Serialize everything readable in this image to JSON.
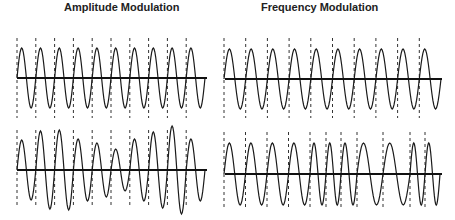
{
  "titles": {
    "am": "Amplitude Modulation",
    "fm": "Frequency Modulation"
  },
  "colors": {
    "wave": "#1a1a1a",
    "axis": "#111111",
    "marker": "#333333",
    "background": "#ffffff"
  },
  "panels": [
    {
      "id": "am-unmodulated",
      "x0": 17,
      "x1": 207,
      "axisY": 78,
      "markerTop": 38,
      "markerBottom": 118,
      "cycles": [
        {
          "start": 17,
          "width": 18.8,
          "amp": 30
        },
        {
          "start": 35.8,
          "width": 18.8,
          "amp": 30
        },
        {
          "start": 54.6,
          "width": 18.8,
          "amp": 30
        },
        {
          "start": 73.4,
          "width": 18.8,
          "amp": 30
        },
        {
          "start": 92.2,
          "width": 18.8,
          "amp": 30
        },
        {
          "start": 111,
          "width": 18.8,
          "amp": 30
        },
        {
          "start": 129.8,
          "width": 18.8,
          "amp": 30
        },
        {
          "start": 148.6,
          "width": 18.8,
          "amp": 30
        },
        {
          "start": 167.4,
          "width": 18.8,
          "amp": 30
        },
        {
          "start": 186.2,
          "width": 18.8,
          "amp": 30
        }
      ]
    },
    {
      "id": "fm-unmodulated",
      "x0": 225,
      "x1": 442,
      "axisY": 79,
      "markerTop": 38,
      "markerBottom": 118,
      "cycles": [
        {
          "start": 224,
          "width": 21.7,
          "amp": 30
        },
        {
          "start": 245.7,
          "width": 21.7,
          "amp": 30
        },
        {
          "start": 267.4,
          "width": 21.7,
          "amp": 30
        },
        {
          "start": 289.1,
          "width": 21.7,
          "amp": 30
        },
        {
          "start": 310.8,
          "width": 21.7,
          "amp": 30
        },
        {
          "start": 332.5,
          "width": 21.7,
          "amp": 30
        },
        {
          "start": 354.2,
          "width": 21.7,
          "amp": 30
        },
        {
          "start": 375.9,
          "width": 21.7,
          "amp": 30
        },
        {
          "start": 397.6,
          "width": 21.7,
          "amp": 30
        },
        {
          "start": 419.3,
          "width": 21.7,
          "amp": 30
        }
      ]
    },
    {
      "id": "am-modulated",
      "x0": 17,
      "x1": 207,
      "axisY": 170,
      "markerTop": 130,
      "markerBottom": 208,
      "cycles": [
        {
          "start": 17,
          "width": 18.8,
          "amp": 30
        },
        {
          "start": 35.8,
          "width": 18.8,
          "amp": 39
        },
        {
          "start": 54.6,
          "width": 18.8,
          "amp": 40
        },
        {
          "start": 73.4,
          "width": 18.8,
          "amp": 31
        },
        {
          "start": 92.2,
          "width": 18.8,
          "amp": 27
        },
        {
          "start": 111,
          "width": 18.8,
          "amp": 21
        },
        {
          "start": 129.8,
          "width": 18.8,
          "amp": 31
        },
        {
          "start": 148.6,
          "width": 18.8,
          "amp": 38
        },
        {
          "start": 167.4,
          "width": 18.8,
          "amp": 44
        },
        {
          "start": 186.2,
          "width": 18.8,
          "amp": 31
        }
      ]
    },
    {
      "id": "fm-modulated",
      "x0": 225,
      "x1": 442,
      "axisY": 174,
      "markerTop": 132,
      "markerBottom": 210,
      "cycles": [
        {
          "start": 224,
          "width": 21.5,
          "amp": 31
        },
        {
          "start": 245.5,
          "width": 21.5,
          "amp": 31
        },
        {
          "start": 267,
          "width": 21.5,
          "amp": 31
        },
        {
          "start": 288.5,
          "width": 21.5,
          "amp": 31
        },
        {
          "start": 310,
          "width": 16,
          "amp": 31
        },
        {
          "start": 326,
          "width": 15,
          "amp": 31
        },
        {
          "start": 341,
          "width": 16,
          "amp": 31
        },
        {
          "start": 357,
          "width": 26,
          "amp": 31
        },
        {
          "start": 383,
          "width": 27,
          "amp": 31
        },
        {
          "start": 410,
          "width": 15,
          "amp": 31
        },
        {
          "start": 425,
          "width": 15,
          "amp": 31
        }
      ]
    }
  ]
}
